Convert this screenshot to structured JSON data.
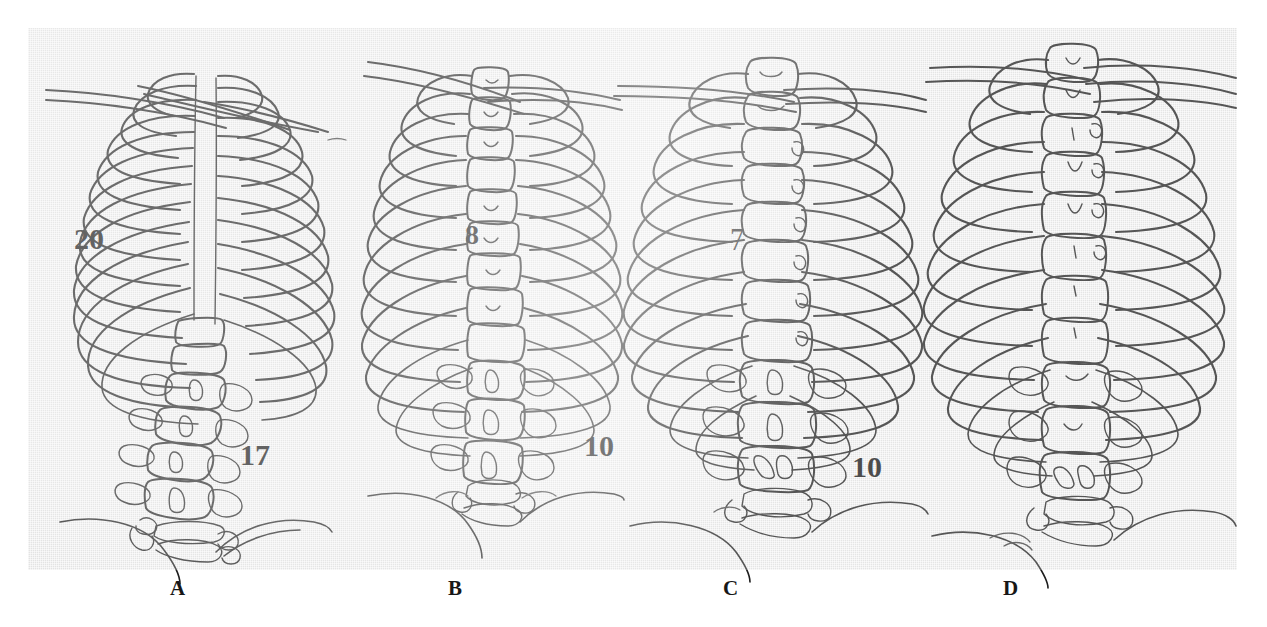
{
  "figure": {
    "type": "anatomical-line-drawing-plate",
    "panel_count": 4,
    "plate_background_color": "#dcdcdc",
    "ink_color": "#1d1d1d",
    "page_background_color": "#ffffff"
  },
  "panels": [
    {
      "id": "A",
      "caption": "A",
      "caption_x": 170,
      "annotations": [
        {
          "text": "20",
          "x": 46,
          "y": 196,
          "size": 30,
          "name": "rib-count-label"
        },
        {
          "text": "17",
          "x": 212,
          "y": 412,
          "size": 30,
          "name": "vertebra-level-label"
        }
      ],
      "rib_pairs": 13,
      "lumbar_vertebrae": 5,
      "description": "Scoliotic thoracic cage with left-shifted rib cage, crowded left ribs, rotated lumbar vertebrae"
    },
    {
      "id": "B",
      "caption": "B",
      "caption_x": 448,
      "annotations": [
        {
          "text": "8",
          "x": 437,
          "y": 193,
          "size": 28,
          "name": "rib-count-label"
        },
        {
          "text": "10",
          "x": 556,
          "y": 403,
          "size": 30,
          "name": "vertebra-level-label"
        }
      ],
      "rib_pairs": 12,
      "lumbar_vertebrae": 5,
      "description": "Mildly curved thoracic spine with visible vertebral bodies and convergent left ribs"
    },
    {
      "id": "C",
      "caption": "C",
      "caption_x": 723,
      "annotations": [
        {
          "text": "7",
          "x": 702,
          "y": 198,
          "size": 28,
          "name": "rib-count-label"
        },
        {
          "text": "10",
          "x": 824,
          "y": 424,
          "size": 30,
          "name": "vertebra-level-label"
        }
      ],
      "rib_pairs": 12,
      "lumbar_vertebrae": 5,
      "description": "Near-symmetric thoracic cage, straight vertical vertebral column"
    },
    {
      "id": "D",
      "caption": "D",
      "caption_x": 1003,
      "annotations": [],
      "rib_pairs": 12,
      "lumbar_vertebrae": 5,
      "description": "Symmetric normal thoracolumbar spine with evenly spaced bilateral ribs"
    }
  ],
  "caption_letters": [
    "A",
    "B",
    "C",
    "D"
  ]
}
